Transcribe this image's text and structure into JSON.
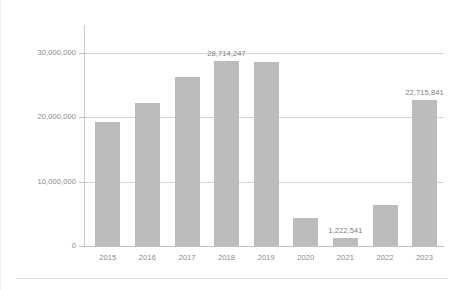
{
  "chart_data": {
    "type": "bar",
    "title": "",
    "subtitle": "",
    "xlabel": "",
    "ylabel": "",
    "categories": [
      "2015",
      "2016",
      "2017",
      "2018",
      "2019",
      "2020",
      "2021",
      "2022",
      "2023"
    ],
    "values": [
      19300000,
      22300000,
      26300000,
      28714247,
      28600000,
      4300000,
      1222541,
      6400000,
      22715841
    ],
    "series": [
      {
        "name": "",
        "values": [
          19300000,
          22300000,
          26300000,
          28714247,
          28600000,
          4300000,
          1222541,
          6400000,
          22715841
        ]
      }
    ],
    "ylim": [
      0,
      32000000
    ],
    "yticks": [
      0,
      10000000,
      20000000,
      30000000
    ],
    "ytick_labels": [
      "0",
      "10,000,000",
      "20,000,000",
      "30,000,000"
    ],
    "grid": true,
    "legend": false,
    "legend_position": "none",
    "bar_color": "#bcbcbc",
    "gridline_color": "#d5d5d5",
    "axis_color": "#c2c2c2",
    "label_color": "#8a8a8a",
    "background": "#ffffff",
    "annotations": [
      {
        "category": "2018",
        "text": "28,714,247",
        "value": 28714247
      },
      {
        "category": "2021",
        "text": "1,222,541",
        "value": 1222541
      },
      {
        "category": "2023",
        "text": "22,715,841",
        "value": 22715841
      }
    ]
  }
}
